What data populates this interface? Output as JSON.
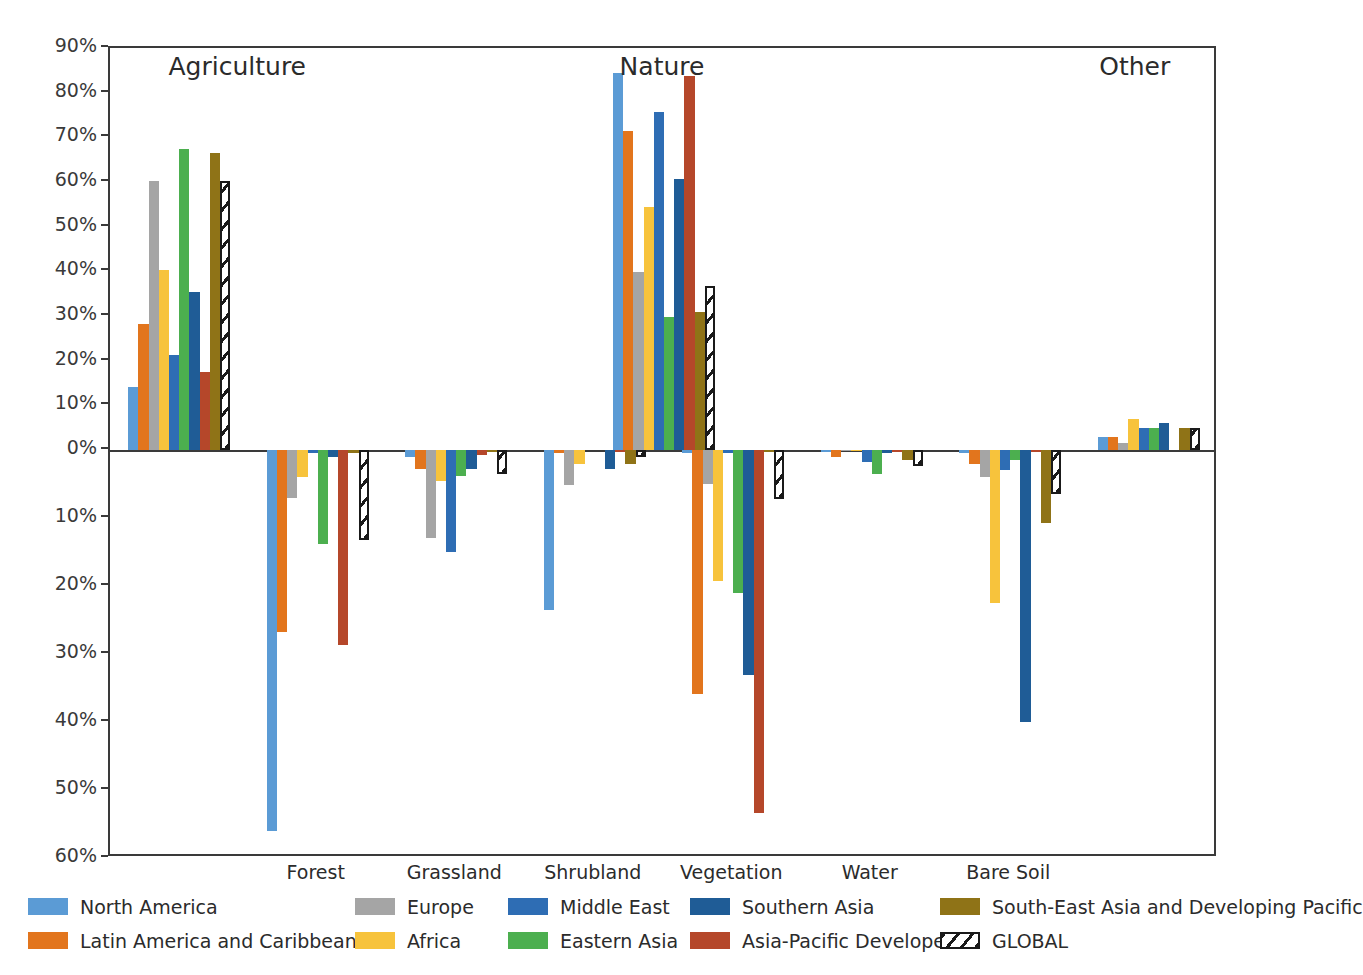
{
  "chart_data": {
    "type": "bar",
    "title": "",
    "xlabel": "",
    "ylabel": "",
    "grid": false,
    "legend_position": "bottom",
    "axis": {
      "positive_ticks": [
        "0%",
        "10%",
        "20%",
        "30%",
        "40%",
        "50%",
        "60%",
        "70%",
        "80%",
        "90%"
      ],
      "negative_ticks": [
        "10%",
        "20%",
        "30%",
        "40%",
        "50%",
        "60%"
      ],
      "ylim_positive": [
        0,
        90
      ],
      "ylim_negative": [
        0,
        60
      ],
      "note": "positive and negative halves use different pixel scales"
    },
    "group_titles": [
      "Agriculture",
      "Nature",
      "Other"
    ],
    "categories": [
      "Agriculture",
      "Forest",
      "Grassland",
      "Shrubland",
      "Vegetation",
      "Water",
      "Bare Soil",
      "Other"
    ],
    "x_tick_labels": [
      "Forest",
      "Grassland",
      "Shrubland",
      "Vegetation",
      "Water",
      "Bare Soil"
    ],
    "series": [
      {
        "name": "North America",
        "color": "#5B9BD5",
        "values": [
          14.2,
          -56.0,
          -1.0,
          -23.6,
          -0.5,
          -0.3,
          -0.5,
          2.9
        ],
        "nature_total": 84.5
      },
      {
        "name": "Latin America and Caribbean",
        "color": "#E2751D",
        "values": [
          28.3,
          -26.8,
          -2.8,
          -0.5,
          -35.9,
          -1.0,
          -2.0,
          3.0
        ],
        "nature_total": 71.5
      },
      {
        "name": "Europe",
        "color": "#A5A5A5",
        "values": [
          60.3,
          -7.0,
          -12.9,
          -5.1,
          -5.0,
          -0.2,
          -4.0,
          1.5
        ],
        "nature_total": 39.8
      },
      {
        "name": "Africa",
        "color": "#F7C33C",
        "values": [
          40.2,
          -4.0,
          -4.5,
          -2.0,
          -19.3,
          -0.2,
          -22.5,
          7.0
        ],
        "nature_total": 54.5
      },
      {
        "name": "Middle East",
        "color": "#2E6DB4",
        "values": [
          21.3,
          -0.5,
          -15.0,
          0.0,
          -0.5,
          -1.8,
          -3.0,
          5.0
        ],
        "nature_total": 75.7
      },
      {
        "name": "Eastern Asia",
        "color": "#4CAF4F",
        "values": [
          67.3,
          -13.8,
          -3.8,
          0.0,
          -21.0,
          -3.5,
          -1.5,
          4.9
        ],
        "nature_total": 29.8
      },
      {
        "name": "Southern Asia",
        "color": "#1F5C96",
        "values": [
          35.4,
          -1.0,
          -2.8,
          -2.8,
          -33.1,
          -0.5,
          -40.0,
          6.1
        ],
        "nature_total": 60.6
      },
      {
        "name": "Asia-Pacific Developed",
        "color": "#B5472A",
        "values": [
          17.4,
          -28.7,
          -0.7,
          -0.3,
          -53.4,
          -0.3,
          -0.3,
          0.0
        ],
        "nature_total": 83.7
      },
      {
        "name": "South-East Asia and Developing Pacific",
        "color": "#8F7317",
        "values": [
          66.4,
          -0.5,
          -0.3,
          -2.1,
          -0.3,
          -1.4,
          -10.8,
          4.9
        ],
        "nature_total": 31.0
      },
      {
        "name": "GLOBAL",
        "color": "hatch",
        "values": [
          60.3,
          -13.3,
          -3.5,
          -1.0,
          -7.2,
          -2.3,
          -6.5,
          5.0
        ],
        "nature_total": 36.7
      }
    ]
  },
  "legend": {
    "columns": [
      [
        {
          "label": "North America",
          "color": "#5B9BD5",
          "style": "solid"
        },
        {
          "label": "Latin America and Caribbean",
          "color": "#E2751D",
          "style": "solid"
        }
      ],
      [
        {
          "label": "Europe",
          "color": "#A5A5A5",
          "style": "solid"
        },
        {
          "label": "Africa",
          "color": "#F7C33C",
          "style": "solid"
        }
      ],
      [
        {
          "label": "Middle East",
          "color": "#2E6DB4",
          "style": "solid"
        },
        {
          "label": "Eastern Asia",
          "color": "#4CAF4F",
          "style": "solid"
        }
      ],
      [
        {
          "label": "Southern Asia",
          "color": "#1F5C96",
          "style": "solid"
        },
        {
          "label": "Asia-Pacific Developed",
          "color": "#B5472A",
          "style": "solid"
        }
      ],
      [
        {
          "label": "South-East Asia and Developing Pacific",
          "color": "#8F7317",
          "style": "solid"
        },
        {
          "label": "GLOBAL",
          "color": "#ffffff",
          "style": "hatch"
        }
      ]
    ]
  }
}
